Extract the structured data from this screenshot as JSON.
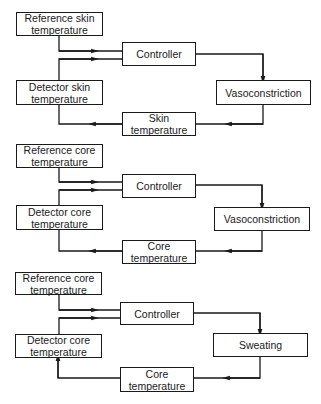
{
  "diagram": {
    "panels": [
      {
        "id": "skin-vasoconstriction",
        "reference": {
          "line1": "Reference skin",
          "line2": "temperature"
        },
        "detector": {
          "line1": "Detector skin",
          "line2": "temperature"
        },
        "controller": {
          "line1": "Controller"
        },
        "effector": {
          "line1": "Vasoconstriction"
        },
        "variable": {
          "line1": "Skin",
          "line2": "temperature"
        }
      },
      {
        "id": "core-vasoconstriction",
        "reference": {
          "line1": "Reference core",
          "line2": "temperature"
        },
        "detector": {
          "line1": "Detector core",
          "line2": "temperature"
        },
        "controller": {
          "line1": "Controller"
        },
        "effector": {
          "line1": "Vasoconstriction"
        },
        "variable": {
          "line1": "Core",
          "line2": "temperature"
        }
      },
      {
        "id": "core-sweating",
        "reference": {
          "line1": "Reference core",
          "line2": "temperature"
        },
        "detector": {
          "line1": "Detector core",
          "line2": "temperature"
        },
        "controller": {
          "line1": "Controller"
        },
        "effector": {
          "line1": "Sweating"
        },
        "variable": {
          "line1": "Core",
          "line2": "temperature"
        }
      }
    ],
    "colors": {
      "line": "#1a1a1a",
      "background": "#ffffff"
    }
  }
}
